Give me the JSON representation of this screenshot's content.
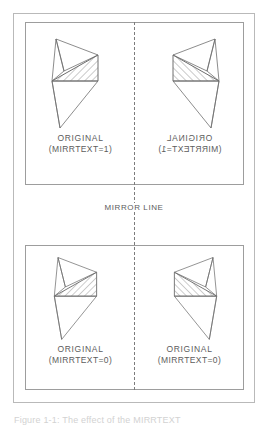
{
  "figure": {
    "mirror_line_label": "MIRROR LINE",
    "caption_partial": "Figure 1-1: The effect of the MIRRTEXT",
    "colors": {
      "outer_frame": "#b9b9b9",
      "panel_border": "#9d9d9d",
      "mirror_line": "#7c7c7c",
      "text": "#5c5c5c",
      "shape_stroke": "#6e6e6e",
      "hatch_stroke": "#8a8a8a",
      "background": "#ffffff"
    }
  },
  "panels": [
    {
      "name": "mirrtext-on-panel",
      "cells": [
        {
          "name": "top-left",
          "title": "ORIGINAL",
          "subtitle": "(MIRRTEXT=1)",
          "text_mirrored": false,
          "shape_mirrored": false
        },
        {
          "name": "top-right",
          "title": "ORIGINAL",
          "subtitle": "(MIRRTEXT=1)",
          "text_mirrored": true,
          "shape_mirrored": true
        }
      ]
    },
    {
      "name": "mirrtext-off-panel",
      "cells": [
        {
          "name": "bottom-left",
          "title": "ORIGINAL",
          "subtitle": "(MIRRTEXT=0)",
          "text_mirrored": false,
          "shape_mirrored": false
        },
        {
          "name": "bottom-right",
          "title": "ORIGINAL",
          "subtitle": "(MIRRTEXT=0)",
          "text_mirrored": false,
          "shape_mirrored": true
        }
      ]
    }
  ]
}
